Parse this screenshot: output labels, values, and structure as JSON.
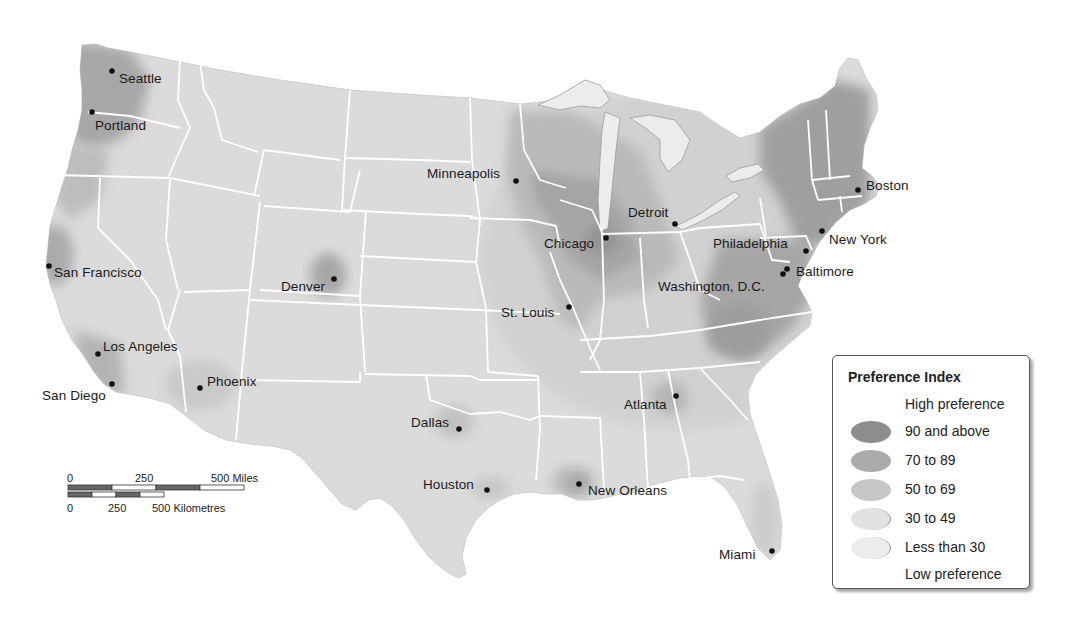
{
  "map": {
    "title": "Preference Index map of the contiguous United States",
    "cities": [
      {
        "name": "Seattle",
        "x": 112,
        "y": 71,
        "lx": 119,
        "ly": 72
      },
      {
        "name": "Portland",
        "x": 92,
        "y": 112,
        "lx": 95,
        "ly": 119
      },
      {
        "name": "San Francisco",
        "x": 49,
        "y": 266,
        "lx": 54,
        "ly": 266
      },
      {
        "name": "Los Angeles",
        "x": 98,
        "y": 354,
        "lx": 103,
        "ly": 340
      },
      {
        "name": "San Diego",
        "x": 112,
        "y": 384,
        "lx": 42,
        "ly": 389
      },
      {
        "name": "Phoenix",
        "x": 200,
        "y": 388,
        "lx": 207,
        "ly": 375
      },
      {
        "name": "Denver",
        "x": 334,
        "y": 279,
        "lx": 281,
        "ly": 280
      },
      {
        "name": "Dallas",
        "x": 459,
        "y": 429,
        "lx": 411,
        "ly": 416
      },
      {
        "name": "Houston",
        "x": 487,
        "y": 490,
        "lx": 423,
        "ly": 478
      },
      {
        "name": "New Orleans",
        "x": 579,
        "y": 484,
        "lx": 588,
        "ly": 484
      },
      {
        "name": "Minneapolis",
        "x": 516,
        "y": 181,
        "lx": 427,
        "ly": 167
      },
      {
        "name": "Chicago",
        "x": 606,
        "y": 238,
        "lx": 544,
        "ly": 237
      },
      {
        "name": "St. Louis",
        "x": 569,
        "y": 307,
        "lx": 501,
        "ly": 306
      },
      {
        "name": "Detroit",
        "x": 675,
        "y": 224,
        "lx": 628,
        "ly": 206
      },
      {
        "name": "Atlanta",
        "x": 676,
        "y": 396,
        "lx": 624,
        "ly": 398
      },
      {
        "name": "Miami",
        "x": 772,
        "y": 551,
        "lx": 719,
        "ly": 548
      },
      {
        "name": "Washington, D.C.",
        "x": 783,
        "y": 274,
        "lx": 658,
        "ly": 280
      },
      {
        "name": "Baltimore",
        "x": 787,
        "y": 269,
        "lx": 796,
        "ly": 265
      },
      {
        "name": "Philadelphia",
        "x": 806,
        "y": 251,
        "lx": 713,
        "ly": 237
      },
      {
        "name": "New York",
        "x": 822,
        "y": 231,
        "lx": 829,
        "ly": 233
      },
      {
        "name": "Boston",
        "x": 858,
        "y": 190,
        "lx": 866,
        "ly": 179
      }
    ]
  },
  "legend": {
    "title": "Preference Index",
    "high_label": "High preference",
    "low_label": "Low preference",
    "classes": [
      {
        "label": "90 and above",
        "color": "#8e8e8e"
      },
      {
        "label": "70 to 89",
        "color": "#ababab"
      },
      {
        "label": "50 to 69",
        "color": "#c6c6c6"
      },
      {
        "label": "30 to 49",
        "color": "#e2e2e2"
      },
      {
        "label": "Less than 30",
        "color": "#ececec"
      }
    ]
  },
  "scale_bar": {
    "miles": {
      "zero": "0",
      "mid": "250",
      "end": "500 Miles"
    },
    "km": {
      "zero": "0",
      "mid": "250",
      "end": "500 Kilometres"
    }
  },
  "colors": {
    "land_base": "#dedede",
    "state_border": "#ffffff",
    "water": "#ffffff",
    "city_dot": "#111111"
  }
}
